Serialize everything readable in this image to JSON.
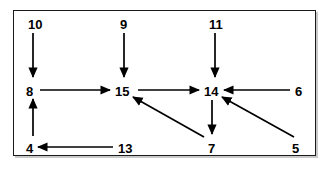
{
  "diagram": {
    "border_color": "#1a1a1a",
    "background_color": "#ffffff",
    "stroke_color": "#000000",
    "nodes": [
      {
        "id": "n10",
        "label": "10",
        "x": 28,
        "y": 18
      },
      {
        "id": "n9",
        "label": "9",
        "x": 120,
        "y": 18
      },
      {
        "id": "n11",
        "label": "11",
        "x": 209,
        "y": 18
      },
      {
        "id": "n8",
        "label": "8",
        "x": 26,
        "y": 85
      },
      {
        "id": "n15",
        "label": "15",
        "x": 115,
        "y": 85
      },
      {
        "id": "n14",
        "label": "14",
        "x": 204,
        "y": 85
      },
      {
        "id": "n6",
        "label": "6",
        "x": 295,
        "y": 85
      },
      {
        "id": "n4",
        "label": "4",
        "x": 26,
        "y": 142
      },
      {
        "id": "n13",
        "label": "13",
        "x": 118,
        "y": 142
      },
      {
        "id": "n7",
        "label": "7",
        "x": 208,
        "y": 142
      },
      {
        "id": "n5",
        "label": "5",
        "x": 292,
        "y": 142
      }
    ],
    "edges": [
      {
        "id": "e10-8",
        "from": "10",
        "to": "8",
        "x1": 33,
        "y1": 33,
        "x2": 33,
        "y2": 77,
        "direction": "down"
      },
      {
        "id": "e9-15",
        "from": "9",
        "to": "15",
        "x1": 124,
        "y1": 33,
        "x2": 124,
        "y2": 77,
        "direction": "down"
      },
      {
        "id": "e11-14",
        "from": "11",
        "to": "14",
        "x1": 215,
        "y1": 33,
        "x2": 215,
        "y2": 77,
        "direction": "down"
      },
      {
        "id": "e4-8",
        "from": "4",
        "to": "8",
        "x1": 33,
        "y1": 136,
        "x2": 33,
        "y2": 99,
        "direction": "up"
      },
      {
        "id": "e8-15",
        "from": "8",
        "to": "15",
        "x1": 40,
        "y1": 90,
        "x2": 110,
        "y2": 90,
        "direction": "right"
      },
      {
        "id": "e15-14",
        "from": "15",
        "to": "14",
        "x1": 138,
        "y1": 90,
        "x2": 199,
        "y2": 90,
        "direction": "right"
      },
      {
        "id": "e6-14",
        "from": "6",
        "to": "14",
        "x1": 290,
        "y1": 90,
        "x2": 224,
        "y2": 90,
        "direction": "left"
      },
      {
        "id": "e13-4",
        "from": "13",
        "to": "4",
        "x1": 113,
        "y1": 147,
        "x2": 38,
        "y2": 147,
        "direction": "left"
      },
      {
        "id": "e14-7",
        "from": "14",
        "to": "7",
        "x1": 212,
        "y1": 100,
        "x2": 212,
        "y2": 134,
        "direction": "down"
      },
      {
        "id": "e7-15",
        "from": "7",
        "to": "15",
        "x1": 204,
        "y1": 137,
        "x2": 133,
        "y2": 97,
        "direction": "diagonal-up-left"
      },
      {
        "id": "e5-14",
        "from": "5",
        "to": "14",
        "x1": 294,
        "y1": 137,
        "x2": 222,
        "y2": 97,
        "direction": "diagonal-up-left"
      }
    ]
  }
}
